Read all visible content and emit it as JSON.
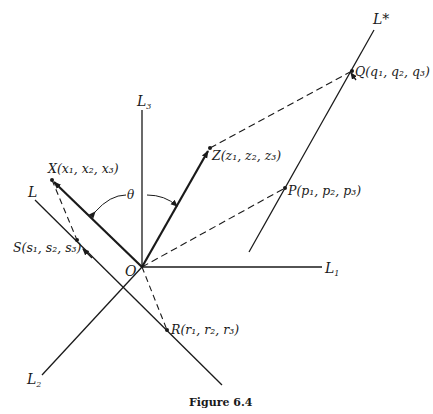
{
  "figure": {
    "caption": "Figure 6.4",
    "axes": {
      "L1": {
        "name": "L",
        "sub": "1"
      },
      "L2": {
        "name": "L",
        "sub": "2"
      },
      "L3": {
        "name": "L",
        "sub": "3"
      }
    },
    "lines": {
      "L": {
        "name": "L"
      },
      "Lstar": {
        "name": "L*"
      }
    },
    "origin": {
      "label": "O"
    },
    "angle": {
      "label": "θ"
    },
    "points": {
      "X": {
        "label": "X(x₁, x₂, x₃)"
      },
      "Z": {
        "label": "Z(z₁, z₂, z₃)"
      },
      "Q": {
        "label": "Q(q₁, q₂, q₃)"
      },
      "P": {
        "label": "P(p₁, p₂, p₃)"
      },
      "S": {
        "label": "S(s₁, s₂, s₃)"
      },
      "R": {
        "label": "R(r₁, r₂, r₃)"
      }
    }
  }
}
